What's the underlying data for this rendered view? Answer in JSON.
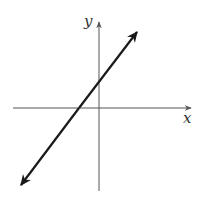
{
  "diagram": {
    "type": "coordinate-plane-line",
    "x_axis_label": "x",
    "y_axis_label": "y",
    "colors": {
      "axis": "#555555",
      "line": "#1a1a1a",
      "label": "#333333",
      "background": "#ffffff"
    },
    "line": {
      "description": "Straight line with positive slope extending in both directions (arrows at both ends)",
      "slope_sign": "positive",
      "x_intercept_sign": "negative",
      "y_intercept_sign": "positive"
    }
  }
}
